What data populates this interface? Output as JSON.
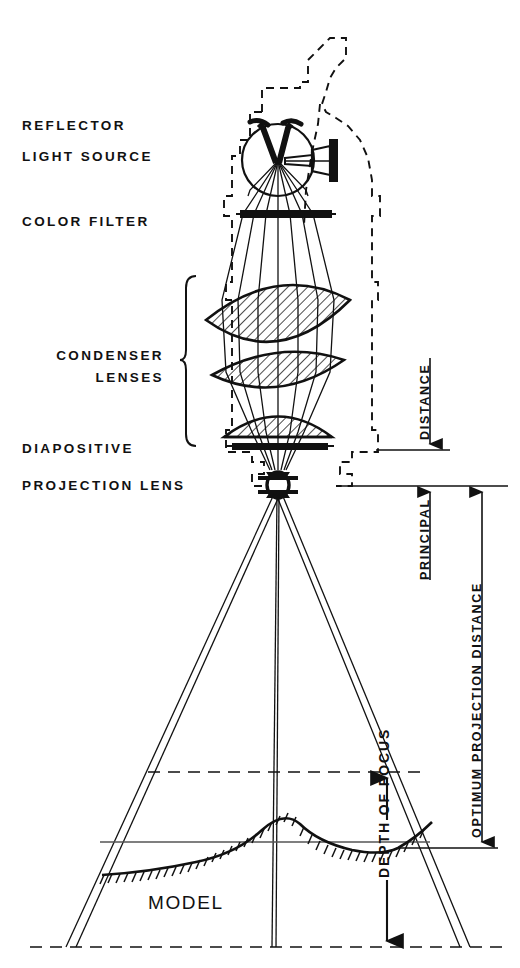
{
  "figure": {
    "background_color": "#ffffff",
    "line_color": "#111111",
    "hatch_color": "#111111"
  },
  "labels": {
    "reflector": "REFLECTOR",
    "light_source": "LIGHT SOURCE",
    "color_filter": "COLOR FILTER",
    "condenser_lenses_line1": "CONDENSER",
    "condenser_lenses_line2": "LENSES",
    "diapositive": "DIAPOSITIVE",
    "projection_lens": "PROJECTION LENS",
    "model": "MODEL"
  },
  "dimension_labels": {
    "principal_distance_part1": "DISTANCE",
    "principal_distance_part2": "PRINCIPAL",
    "optimum_projection_distance": "OPTIMUM  PROJECTION  DISTANCE",
    "depth_of_focus": "DEPTH OF FOCUS"
  },
  "components": {
    "housing": "dashed projector housing outline",
    "lamp": "arc lamp with spherical reflector and twin carbon electrodes",
    "filter_bar": "color filter bar",
    "lens_1": "large biconvex condenser lens",
    "lens_2": "meniscus condenser lens",
    "lens_3": "plano-convex condenser lens",
    "slide": "diapositive slide bar",
    "objective": "projection lens assembly",
    "terrain": "relief model surface profile with hatched ground"
  }
}
